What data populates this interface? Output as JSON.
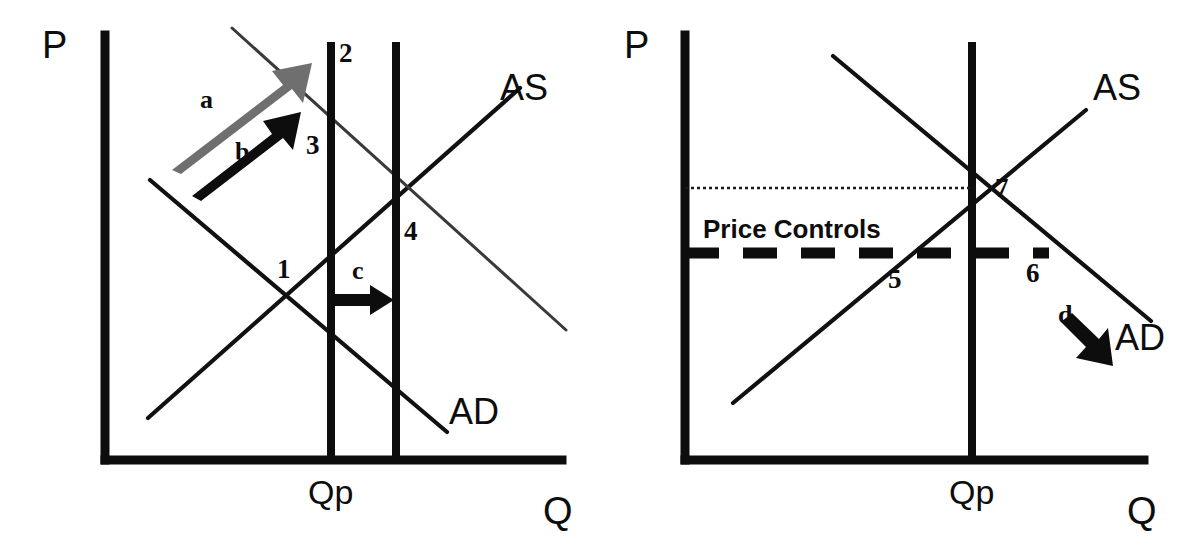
{
  "figure": {
    "type": "diagram",
    "background_color": "#ffffff",
    "ink_color": "#0d0d0d",
    "secondary_ink_color": "#6f6f6f"
  },
  "left_panel": {
    "name": "AD shift panel",
    "axes": {
      "y_label": "P",
      "x_label": "Q"
    },
    "tick_label": "Qp",
    "curve_labels": {
      "supply": "AS",
      "demand": "AD"
    },
    "point_labels": [
      "1",
      "2",
      "3",
      "4"
    ],
    "arrow_labels": {
      "a": "a",
      "b": "b",
      "c": "c"
    },
    "arrows": [
      {
        "id": "a",
        "label": "a",
        "style": "outline-gray",
        "direction": "up-right"
      },
      {
        "id": "b",
        "label": "b",
        "style": "solid-black",
        "direction": "up-right"
      },
      {
        "id": "c",
        "label": "c",
        "style": "solid-black",
        "direction": "right"
      }
    ]
  },
  "right_panel": {
    "name": "Price controls panel",
    "axes": {
      "y_label": "P",
      "x_label": "Q"
    },
    "tick_label": "Qp",
    "curve_labels": {
      "supply": "AS",
      "demand": "AD"
    },
    "point_labels": [
      "5",
      "6",
      "7"
    ],
    "annotation": "Price Controls",
    "arrow_labels": {
      "d": "d"
    },
    "arrows": [
      {
        "id": "d",
        "label": "d",
        "style": "solid-black",
        "direction": "down-right"
      }
    ],
    "lines": {
      "equilibrium_price_guide": "dotted",
      "price_control_ceiling": "dashed-bold"
    }
  }
}
